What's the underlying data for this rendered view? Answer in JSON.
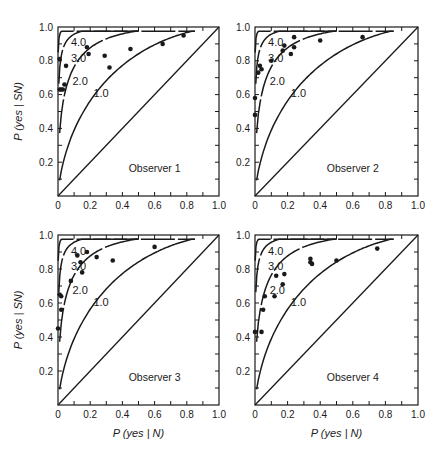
{
  "chart_data": [
    {
      "type": "scatter",
      "title": "Observer 1",
      "xlabel": "",
      "ylabel": "P(yes | SN)",
      "xlim": [
        0,
        1.0
      ],
      "ylim": [
        0,
        1.0
      ],
      "xticks": [
        "0",
        "0.2",
        "0.4",
        "0.6",
        "0.8",
        "1.0"
      ],
      "yticks": [
        "0.2",
        "0.4",
        "0.6",
        "0.8",
        "1.0"
      ],
      "curves": [
        {
          "label": "4.0"
        },
        {
          "label": "3.0"
        },
        {
          "label": "2.0"
        },
        {
          "label": "1.0"
        }
      ],
      "points": [
        [
          0.01,
          0.81
        ],
        [
          0.01,
          0.63
        ],
        [
          0.02,
          0.63
        ],
        [
          0.03,
          0.63
        ],
        [
          0.05,
          0.77
        ],
        [
          0.04,
          0.66
        ],
        [
          0.18,
          0.88
        ],
        [
          0.19,
          0.84
        ],
        [
          0.29,
          0.83
        ],
        [
          0.32,
          0.76
        ],
        [
          0.45,
          0.87
        ],
        [
          0.65,
          0.9
        ],
        [
          0.78,
          0.95
        ]
      ]
    },
    {
      "type": "scatter",
      "title": "Observer 2",
      "xlabel": "",
      "ylabel": "",
      "xlim": [
        0,
        1.0
      ],
      "ylim": [
        0,
        1.0
      ],
      "xticks": [
        "0",
        "0.2",
        "0.4",
        "0.6",
        "0.8",
        "1.0"
      ],
      "yticks": [
        "0.2",
        "0.4",
        "0.6",
        "0.8",
        "1.0"
      ],
      "curves": [
        {
          "label": "4.0"
        },
        {
          "label": "3.0"
        },
        {
          "label": "2.0"
        },
        {
          "label": "1.0"
        }
      ],
      "points": [
        [
          0.0,
          0.58
        ],
        [
          0.0,
          0.48
        ],
        [
          0.02,
          0.73
        ],
        [
          0.03,
          0.77
        ],
        [
          0.04,
          0.75
        ],
        [
          0.1,
          0.8
        ],
        [
          0.17,
          0.86
        ],
        [
          0.18,
          0.89
        ],
        [
          0.22,
          0.84
        ],
        [
          0.24,
          0.88
        ],
        [
          0.24,
          0.94
        ],
        [
          0.4,
          0.92
        ],
        [
          0.66,
          0.94
        ]
      ]
    },
    {
      "type": "scatter",
      "title": "Observer 3",
      "xlabel": "P(yes | N)",
      "ylabel": "P(yes | SN)",
      "xlim": [
        0,
        1.0
      ],
      "ylim": [
        0,
        1.0
      ],
      "xticks": [
        "0",
        "0.2",
        "0.4",
        "0.6",
        "0.8",
        "1.0"
      ],
      "yticks": [
        "0.2",
        "0.4",
        "0.6",
        "0.8",
        "1.0"
      ],
      "curves": [
        {
          "label": "4.0"
        },
        {
          "label": "3.0"
        },
        {
          "label": "2.0"
        },
        {
          "label": "1.0"
        }
      ],
      "points": [
        [
          0.0,
          0.45
        ],
        [
          0.01,
          0.65
        ],
        [
          0.02,
          0.64
        ],
        [
          0.02,
          0.56
        ],
        [
          0.08,
          0.73
        ],
        [
          0.12,
          0.88
        ],
        [
          0.14,
          0.84
        ],
        [
          0.15,
          0.78
        ],
        [
          0.18,
          0.9
        ],
        [
          0.24,
          0.87
        ],
        [
          0.34,
          0.85
        ],
        [
          0.6,
          0.93
        ]
      ]
    },
    {
      "type": "scatter",
      "title": "Observer 4",
      "xlabel": "P(yes | N)",
      "ylabel": "",
      "xlim": [
        0,
        1.0
      ],
      "ylim": [
        0,
        1.0
      ],
      "xticks": [
        "0",
        "0.2",
        "0.4",
        "0.6",
        "0.8",
        "1.0"
      ],
      "yticks": [
        "0.2",
        "0.4",
        "0.6",
        "0.8",
        "1.0"
      ],
      "curves": [
        {
          "label": "4.0"
        },
        {
          "label": "3.0"
        },
        {
          "label": "2.0"
        },
        {
          "label": "1.0"
        }
      ],
      "points": [
        [
          0.0,
          0.43
        ],
        [
          0.04,
          0.43
        ],
        [
          0.05,
          0.56
        ],
        [
          0.06,
          0.64
        ],
        [
          0.12,
          0.64
        ],
        [
          0.13,
          0.76
        ],
        [
          0.17,
          0.71
        ],
        [
          0.18,
          0.77
        ],
        [
          0.34,
          0.86
        ],
        [
          0.34,
          0.84
        ],
        [
          0.35,
          0.83
        ],
        [
          0.5,
          0.85
        ],
        [
          0.75,
          0.92
        ]
      ]
    }
  ],
  "figure": {
    "panels": [
      {
        "observer_label": "Observer 1",
        "y_axis_title": "P (yes | SN)",
        "x_axis_title": ""
      },
      {
        "observer_label": "Observer 2",
        "y_axis_title": "",
        "x_axis_title": ""
      },
      {
        "observer_label": "Observer 3",
        "y_axis_title": "P (yes | SN)",
        "x_axis_title": "P (yes | N)"
      },
      {
        "observer_label": "Observer 4",
        "y_axis_title": "",
        "x_axis_title": "P (yes | N)"
      }
    ],
    "curve_labels": [
      "4.0",
      "3.0",
      "2.0",
      "1.0"
    ],
    "xtick_labels": [
      "0",
      "0.2",
      "0.4",
      "0.6",
      "0.8",
      "1.0"
    ],
    "ytick_labels": [
      "0.2",
      "0.4",
      "0.6",
      "0.8",
      "1.0"
    ]
  }
}
